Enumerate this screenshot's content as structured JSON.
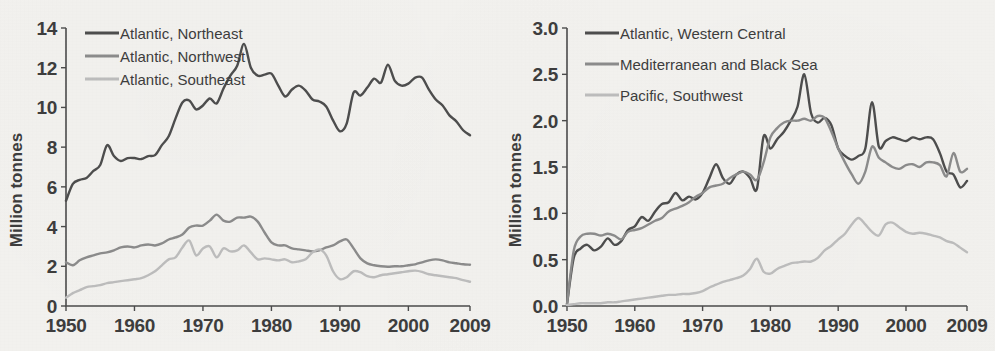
{
  "background_color": "#f3f2ef",
  "colors": {
    "dark": "#4d4d4d",
    "medium": "#8b8b8b",
    "light": "#bcbcbc",
    "axis": "#4b4b4b",
    "text": "#3d3d3d"
  },
  "chart_data": [
    {
      "type": "line",
      "panel": "left",
      "title": "",
      "xlabel": "",
      "ylabel": "Million tonnes",
      "xlim": [
        1950,
        2009
      ],
      "ylim": [
        0,
        14
      ],
      "xticks": [
        1950,
        1960,
        1970,
        1980,
        1990,
        2000,
        2009
      ],
      "xtick_labels": [
        "1950",
        "1960",
        "1970",
        "1980",
        "1990",
        "2000",
        "2009"
      ],
      "yticks": [
        0,
        2,
        4,
        6,
        8,
        10,
        12,
        14
      ],
      "ytick_labels": [
        "0",
        "2",
        "4",
        "6",
        "8",
        "10",
        "12",
        "14"
      ],
      "grid": false,
      "legend_position": "top-left",
      "x": [
        1950,
        1951,
        1952,
        1953,
        1954,
        1955,
        1956,
        1957,
        1958,
        1959,
        1960,
        1961,
        1962,
        1963,
        1964,
        1965,
        1966,
        1967,
        1968,
        1969,
        1970,
        1971,
        1972,
        1973,
        1974,
        1975,
        1976,
        1977,
        1978,
        1979,
        1980,
        1981,
        1982,
        1983,
        1984,
        1985,
        1986,
        1987,
        1988,
        1989,
        1990,
        1991,
        1992,
        1993,
        1994,
        1995,
        1996,
        1997,
        1998,
        1999,
        2000,
        2001,
        2002,
        2003,
        2004,
        2005,
        2006,
        2007,
        2008,
        2009
      ],
      "series": [
        {
          "name": "Atlantic, Northeast",
          "color": "#4d4d4d",
          "values": [
            5.3,
            6.15,
            6.35,
            6.45,
            6.8,
            7.1,
            8.1,
            7.55,
            7.3,
            7.45,
            7.45,
            7.4,
            7.55,
            7.6,
            8.1,
            8.55,
            9.45,
            10.25,
            10.35,
            9.9,
            10.1,
            10.45,
            10.2,
            10.95,
            11.6,
            12.1,
            13.2,
            12.0,
            11.6,
            11.65,
            11.7,
            11.1,
            10.55,
            10.9,
            11.1,
            10.85,
            10.4,
            10.3,
            10.05,
            9.35,
            8.8,
            9.2,
            10.75,
            10.6,
            11.0,
            11.45,
            11.25,
            12.15,
            11.35,
            11.1,
            11.2,
            11.5,
            11.5,
            10.9,
            10.4,
            10.1,
            9.6,
            9.3,
            8.85,
            8.6
          ]
        },
        {
          "name": "Atlantic, Northwest",
          "color": "#8b8b8b",
          "values": [
            2.2,
            2.05,
            2.3,
            2.45,
            2.55,
            2.65,
            2.7,
            2.8,
            2.95,
            3.0,
            2.95,
            3.05,
            3.1,
            3.05,
            3.15,
            3.35,
            3.45,
            3.6,
            3.95,
            4.05,
            4.05,
            4.3,
            4.6,
            4.3,
            4.25,
            4.45,
            4.45,
            4.5,
            4.25,
            3.7,
            3.2,
            3.05,
            3.05,
            2.9,
            2.85,
            2.8,
            2.75,
            2.8,
            2.95,
            3.05,
            3.25,
            3.35,
            2.9,
            2.4,
            2.15,
            2.05,
            2.0,
            1.98,
            2.0,
            2.0,
            2.05,
            2.1,
            2.2,
            2.3,
            2.35,
            2.3,
            2.2,
            2.15,
            2.1,
            2.08
          ]
        },
        {
          "name": "Atlantic, Southeast",
          "color": "#bcbcbc",
          "values": [
            0.42,
            0.65,
            0.8,
            0.95,
            1.0,
            1.05,
            1.15,
            1.2,
            1.25,
            1.3,
            1.35,
            1.4,
            1.55,
            1.75,
            2.05,
            2.35,
            2.45,
            2.95,
            3.3,
            2.55,
            2.9,
            3.0,
            2.45,
            2.9,
            2.75,
            2.8,
            3.05,
            2.7,
            2.35,
            2.4,
            2.35,
            2.3,
            2.35,
            2.2,
            2.25,
            2.35,
            2.7,
            2.85,
            2.55,
            1.75,
            1.35,
            1.45,
            1.75,
            1.7,
            1.5,
            1.45,
            1.55,
            1.6,
            1.65,
            1.7,
            1.75,
            1.78,
            1.72,
            1.6,
            1.55,
            1.5,
            1.45,
            1.4,
            1.3,
            1.22
          ]
        }
      ]
    },
    {
      "type": "line",
      "panel": "right",
      "title": "",
      "xlabel": "",
      "ylabel": "Million tonnes",
      "xlim": [
        1950,
        2009
      ],
      "ylim": [
        0,
        3.0
      ],
      "xticks": [
        1950,
        1960,
        1970,
        1980,
        1990,
        2000,
        2009
      ],
      "xtick_labels": [
        "1950",
        "1960",
        "1970",
        "1980",
        "1990",
        "2000",
        "2009"
      ],
      "yticks": [
        0,
        0.5,
        1.0,
        1.5,
        2.0,
        2.5,
        3.0
      ],
      "ytick_labels": [
        "0.0",
        "0.5",
        "1.0",
        "1.5",
        "2.0",
        "2.5",
        "3.0"
      ],
      "grid": false,
      "legend_position": "top-left",
      "x": [
        1950,
        1951,
        1952,
        1953,
        1954,
        1955,
        1956,
        1957,
        1958,
        1959,
        1960,
        1961,
        1962,
        1963,
        1964,
        1965,
        1966,
        1967,
        1968,
        1969,
        1970,
        1971,
        1972,
        1973,
        1974,
        1975,
        1976,
        1977,
        1978,
        1979,
        1980,
        1981,
        1982,
        1983,
        1984,
        1985,
        1986,
        1987,
        1988,
        1989,
        1990,
        1991,
        1992,
        1993,
        1994,
        1995,
        1996,
        1997,
        1998,
        1999,
        2000,
        2001,
        2002,
        2003,
        2004,
        2005,
        2006,
        2007,
        2008,
        2009
      ],
      "series": [
        {
          "name": "Atlantic, Western Central",
          "color": "#4d4d4d",
          "values": [
            0.02,
            0.52,
            0.62,
            0.66,
            0.6,
            0.64,
            0.73,
            0.66,
            0.7,
            0.82,
            0.86,
            0.96,
            0.92,
            1.02,
            1.1,
            1.12,
            1.22,
            1.14,
            1.18,
            1.15,
            1.22,
            1.38,
            1.53,
            1.38,
            1.32,
            1.42,
            1.45,
            1.38,
            1.26,
            1.83,
            1.7,
            1.8,
            1.88,
            2.0,
            2.15,
            2.5,
            2.08,
            1.98,
            2.03,
            1.95,
            1.7,
            1.62,
            1.58,
            1.62,
            1.7,
            2.2,
            1.72,
            1.78,
            1.82,
            1.8,
            1.78,
            1.82,
            1.8,
            1.82,
            1.8,
            1.65,
            1.45,
            1.42,
            1.28,
            1.35
          ]
        },
        {
          "name": "Mediterranean and Black Sea",
          "color": "#8b8b8b",
          "values": [
            0.02,
            0.6,
            0.75,
            0.78,
            0.78,
            0.76,
            0.78,
            0.76,
            0.72,
            0.8,
            0.82,
            0.84,
            0.88,
            0.92,
            0.95,
            1.02,
            1.05,
            1.08,
            1.12,
            1.18,
            1.22,
            1.28,
            1.3,
            1.32,
            1.38,
            1.42,
            1.45,
            1.42,
            1.36,
            1.55,
            1.82,
            1.92,
            1.98,
            2.0,
            2.0,
            2.02,
            2.0,
            2.05,
            2.03,
            1.88,
            1.7,
            1.55,
            1.42,
            1.32,
            1.45,
            1.72,
            1.6,
            1.55,
            1.5,
            1.48,
            1.52,
            1.53,
            1.5,
            1.55,
            1.55,
            1.52,
            1.4,
            1.65,
            1.45,
            1.48
          ]
        },
        {
          "name": "Pacific, Southwest",
          "color": "#bcbcbc",
          "values": [
            0.01,
            0.02,
            0.03,
            0.03,
            0.03,
            0.03,
            0.04,
            0.04,
            0.05,
            0.06,
            0.07,
            0.08,
            0.09,
            0.1,
            0.11,
            0.12,
            0.12,
            0.13,
            0.13,
            0.14,
            0.16,
            0.2,
            0.23,
            0.26,
            0.28,
            0.3,
            0.33,
            0.4,
            0.51,
            0.37,
            0.35,
            0.4,
            0.43,
            0.46,
            0.47,
            0.48,
            0.48,
            0.52,
            0.6,
            0.65,
            0.72,
            0.78,
            0.88,
            0.95,
            0.88,
            0.8,
            0.76,
            0.88,
            0.9,
            0.85,
            0.8,
            0.78,
            0.79,
            0.78,
            0.76,
            0.74,
            0.7,
            0.68,
            0.63,
            0.58
          ]
        }
      ]
    }
  ]
}
